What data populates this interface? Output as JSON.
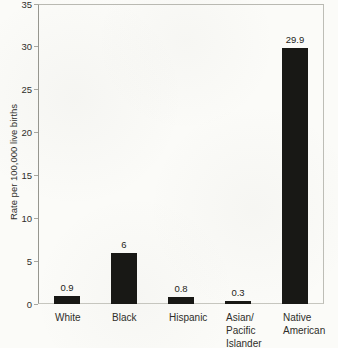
{
  "chart_data": {
    "type": "bar",
    "title": "",
    "xlabel": "",
    "ylabel": "Rate per 100,000 live births",
    "categories": [
      "White",
      "Black",
      "Hispanic",
      "Asian/\nPacific\nIslander",
      "Native\nAmerican"
    ],
    "values": [
      0.9,
      6,
      0.8,
      0.3,
      29.9
    ],
    "value_labels": [
      "0.9",
      "6",
      "0.8",
      "0.3",
      "29.9"
    ],
    "ylim": [
      0,
      35
    ],
    "yticks": [
      {
        "value": 0,
        "label": "0"
      },
      {
        "value": 5,
        "label": "5"
      },
      {
        "value": 10,
        "label": "10"
      },
      {
        "value": 15,
        "label": "15"
      },
      {
        "value": 20,
        "label": "20"
      },
      {
        "value": 25,
        "label": "25"
      },
      {
        "value": 30,
        "label": "30"
      },
      {
        "value": 35,
        "label": "35"
      }
    ],
    "grid": false,
    "legend": null,
    "bar_color": "#181815"
  },
  "style": {
    "background": "#fbfbf8",
    "frame_color": "#b9b9b2",
    "axis_color": "#96968f",
    "text_color": "#2e2e2a"
  }
}
